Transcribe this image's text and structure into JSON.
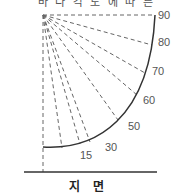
{
  "title_clipped": "바 다 각 도 에 따 른",
  "diagram": {
    "type": "angle-fan",
    "angle_labels": [
      "15",
      "30",
      "50",
      "60",
      "70",
      "80",
      "90"
    ],
    "ground_label": "지 면",
    "colors": {
      "dashed_lines": "#666666",
      "arc": "#333333",
      "ground": "#333333",
      "labels": "#555555"
    }
  }
}
